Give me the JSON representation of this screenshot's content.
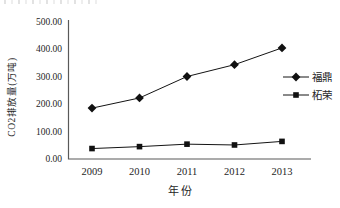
{
  "chart_data": {
    "type": "line",
    "title": "",
    "xlabel": "年份",
    "ylabel": "CO2排放量(万吨)",
    "x_categories": [
      "2009",
      "2010",
      "2011",
      "2012",
      "2013"
    ],
    "series": [
      {
        "name": "福鼎",
        "marker": "diamond",
        "values": [
          185,
          222,
          300,
          343,
          404
        ]
      },
      {
        "name": "柘荣",
        "marker": "square",
        "values": [
          38,
          45,
          54,
          51,
          64
        ]
      }
    ],
    "ylim": [
      0,
      500
    ],
    "ytick_step": 100,
    "ytick_labels": [
      "0.00",
      "100.00",
      "200.00",
      "300.00",
      "400.00",
      "500.00"
    ],
    "grid": false,
    "legend_position": "right"
  },
  "colors": {
    "axis": "#595959",
    "series_line": "#141414",
    "marker_fill": "#111111",
    "text": "#262626",
    "background": "#ffffff"
  }
}
